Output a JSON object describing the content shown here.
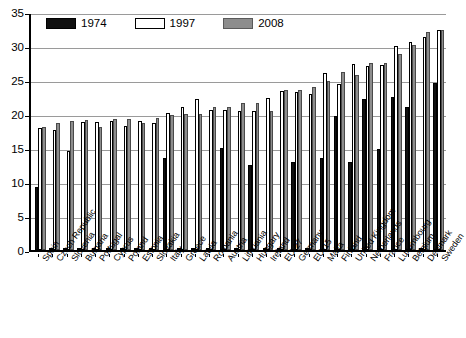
{
  "chart_data": {
    "type": "bar",
    "title": "",
    "subtitle": "",
    "xlabel": "",
    "ylabel": "",
    "ylim": [
      0,
      35
    ],
    "yticks": [
      0,
      5,
      10,
      15,
      20,
      25,
      30,
      35
    ],
    "grid": true,
    "legend_position": "top-left",
    "orientation": "vertical",
    "group_mode": "grouped",
    "categories": [
      "Spain",
      "Czech Republic",
      "Slovenia",
      "Bulgaria",
      "Portugal",
      "Cyprus",
      "Poland",
      "Estonia",
      "Slovakia",
      "Italy",
      "Greece",
      "Latvia",
      "Romania",
      "Austria",
      "Lithuania",
      "Hungary",
      "Ireland",
      "EU-27",
      "Germany",
      "EU-15",
      "Malta",
      "Finland",
      "United Kingdom",
      "Netherlands",
      "France",
      "Luxembourg",
      "Belgium",
      "Denmark",
      "Sweden"
    ],
    "series": [
      {
        "name": "1974",
        "color": "#101010",
        "values": [
          9.3,
          0.3,
          0.3,
          0.3,
          0.3,
          0.3,
          0.3,
          0.3,
          0.3,
          13.5,
          0.3,
          0.3,
          0.3,
          15.0,
          0.3,
          12.5,
          0.3,
          0.3,
          13.0,
          0.3,
          13.5,
          19.7,
          13.0,
          22.2,
          14.8,
          22.5,
          21.0,
          0.3,
          24.5
        ]
      },
      {
        "name": "1997",
        "color": "#ffffff",
        "values": [
          18.0,
          17.7,
          14.5,
          18.8,
          18.8,
          18.9,
          18.3,
          19.0,
          18.7,
          20.1,
          21.1,
          22.2,
          20.6,
          20.6,
          20.5,
          20.5,
          22.3,
          23.4,
          23.3,
          23.0,
          26.0,
          24.4,
          27.3,
          27.1,
          27.2,
          30.0,
          30.6,
          31.3,
          32.3
        ]
      },
      {
        "name": "2008",
        "color": "#8d8d8d",
        "values": [
          18.1,
          18.7,
          18.9,
          19.1,
          18.1,
          19.2,
          19.3,
          18.7,
          19.4,
          19.8,
          20.0,
          20.0,
          21.0,
          21.1,
          21.6,
          21.6,
          20.4,
          23.5,
          23.5,
          24.0,
          24.8,
          26.2,
          25.8,
          27.5,
          27.5,
          28.8,
          30.1,
          32.1,
          32.4
        ]
      }
    ]
  },
  "legend": {
    "items": [
      {
        "label": "1974",
        "swatch": "black-filled-swatch"
      },
      {
        "label": "1997",
        "swatch": "white-outlined-swatch"
      },
      {
        "label": "2008",
        "swatch": "gray-filled-swatch"
      }
    ]
  }
}
